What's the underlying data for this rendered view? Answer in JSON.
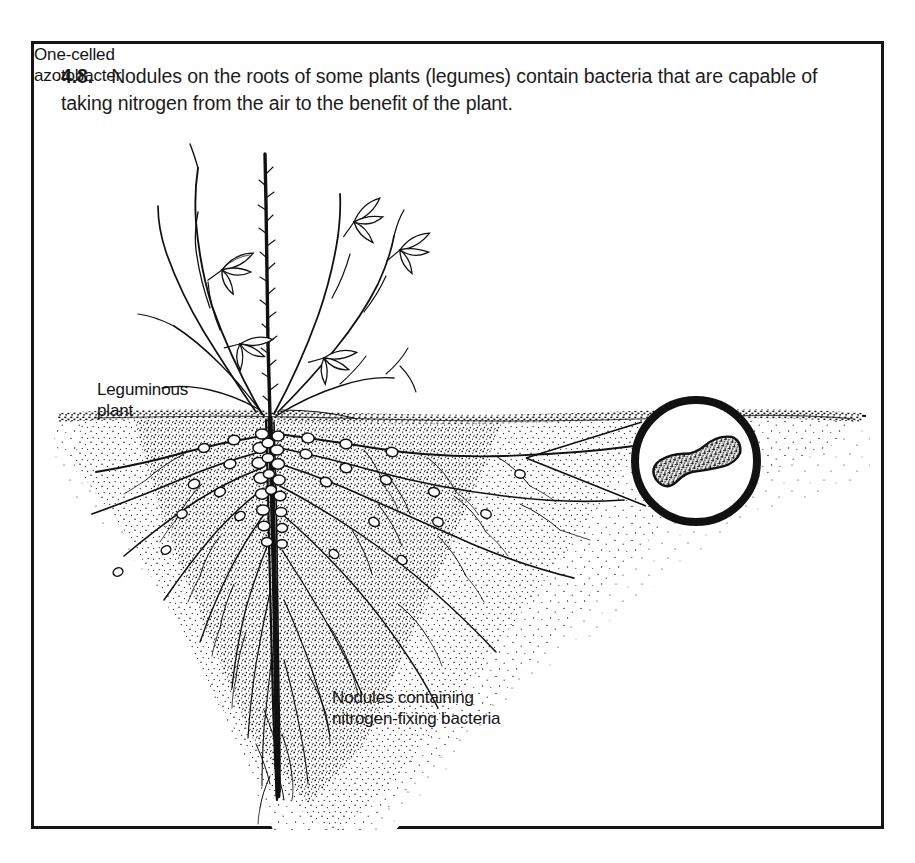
{
  "figure": {
    "number": "4.8.",
    "caption": "Nodules on the roots of some plants (legumes) contain bacteria that are capable of taking nitrogen from the air to the benefit of the plant."
  },
  "labels": {
    "leguminous_plant": "Leguminous\nplant",
    "nodules": "Nodules containing\nnitrogen-fixing bacteria",
    "azotobacter": "One-celled\nazotobacter"
  },
  "illustration": {
    "style": "black-and-white line drawing with stipple shading",
    "elements": [
      "leguminous-plant",
      "soil-line",
      "soil-stipple",
      "taproot",
      "lateral-roots",
      "root-nodules",
      "magnifier-circle",
      "magnifier-leader-lines",
      "azotobacter-cell"
    ],
    "soil_line_y": 371,
    "magnifier": {
      "center_x": 662,
      "center_y": 417,
      "radius": 61,
      "stroke_width": 8
    },
    "colors": {
      "ink": "#111111",
      "paper": "#ffffff",
      "frame": "#151515"
    }
  }
}
